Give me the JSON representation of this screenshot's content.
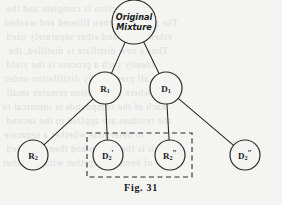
{
  "figure": {
    "caption": "Fig. 31",
    "type": "binary-tree-diagram",
    "ink_color": "#2b2b2b",
    "background_color": "#f4f4f2"
  },
  "nodes": [
    {
      "id": "root",
      "label_line1": "Original",
      "label_line2": "Mixture",
      "style": "script",
      "cx": 134,
      "cy": 22,
      "r": 22
    },
    {
      "id": "r1",
      "base": "R",
      "sub": "1",
      "prime": "",
      "style": "sym",
      "cx": 105,
      "cy": 88,
      "r": 16
    },
    {
      "id": "d1",
      "base": "D",
      "sub": "1",
      "prime": "",
      "style": "sym",
      "cx": 166,
      "cy": 88,
      "r": 16
    },
    {
      "id": "r2",
      "base": "R",
      "sub": "2",
      "prime": "",
      "style": "sym",
      "cx": 33,
      "cy": 155,
      "r": 15
    },
    {
      "id": "d2p",
      "base": "D",
      "sub": "2",
      "prime": "′",
      "style": "sym",
      "cx": 108,
      "cy": 155,
      "r": 15
    },
    {
      "id": "r2pp",
      "base": "R",
      "sub": "2",
      "prime": "″",
      "style": "sym",
      "cx": 170,
      "cy": 155,
      "r": 15
    },
    {
      "id": "d2pp",
      "base": "D",
      "sub": "2",
      "prime": "″",
      "style": "sym",
      "cx": 245,
      "cy": 155,
      "r": 15
    }
  ],
  "edges": [
    {
      "from": "root",
      "to": "r1"
    },
    {
      "from": "root",
      "to": "d1"
    },
    {
      "from": "r1",
      "to": "r2"
    },
    {
      "from": "r1",
      "to": "d2p"
    },
    {
      "from": "d1",
      "to": "r2pp"
    },
    {
      "from": "d1",
      "to": "d2pp"
    }
  ],
  "selection_box": {
    "style": "dashed",
    "x": 87,
    "y": 133,
    "width": 105,
    "height": 44,
    "encloses": [
      "d2p",
      "r2pp"
    ]
  },
  "bleed_text": [
    {
      "text": "the reaction is complete and the",
      "x": 6,
      "y": 4
    },
    {
      "text": "The product is then filtered and washed",
      "x": 4,
      "y": 18
    },
    {
      "text": "ether if will and ether separately used",
      "x": 6,
      "y": 32
    },
    {
      "text": "Thus a new distillate is distilled, the",
      "x": 8,
      "y": 46
    },
    {
      "text": "Ideally such a process is the yield",
      "x": 6,
      "y": 60
    },
    {
      "text": "all prepared by distillation under",
      "x": 4,
      "y": 74
    },
    {
      "text": "where the solution remains small",
      "x": 6,
      "y": 88
    },
    {
      "text": "each of the compounds is identical to",
      "x": 2,
      "y": 102
    },
    {
      "text": "the residues are applied to the second",
      "x": 6,
      "y": 116
    },
    {
      "text": "to determine whether a separate",
      "x": 4,
      "y": 130
    },
    {
      "text": "it is then again and then collected",
      "x": 6,
      "y": 144
    },
    {
      "text": "layer of benzene together with the other",
      "x": 2,
      "y": 158
    }
  ]
}
